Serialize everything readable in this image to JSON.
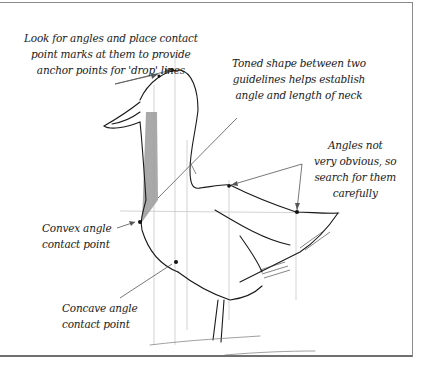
{
  "figure": {
    "annotations": [
      {
        "id": "anchor-points",
        "lines": [
          "Look for angles and place contact",
          "point marks at them to provide",
          "anchor points for 'drop' lines"
        ]
      },
      {
        "id": "toned-shape",
        "lines": [
          "Toned shape between two",
          "guidelines helps establish",
          "angle and length of neck"
        ]
      },
      {
        "id": "angles-not-obvious",
        "lines": [
          "Angles not",
          "very obvious, so",
          "search for them",
          "carefully"
        ]
      },
      {
        "id": "convex-angle",
        "lines": [
          "Convex angle",
          "contact point"
        ]
      },
      {
        "id": "concave-angle",
        "lines": [
          "Concave angle",
          "contact point"
        ]
      }
    ],
    "colors": {
      "ink": "#1a1a1a",
      "tone": "#9a9a9a",
      "guide": "#c8c8c8",
      "frame": "#8a8a8a"
    }
  }
}
